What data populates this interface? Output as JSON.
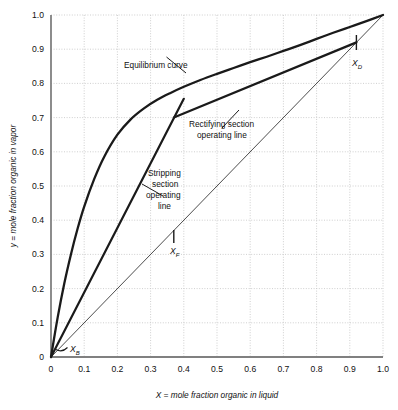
{
  "chart_data": {
    "type": "line",
    "title": "",
    "xlabel": "X = mole fraction organic in liquid",
    "ylabel": "y = mole fraction organic in vapor",
    "xlim": [
      0,
      1.0
    ],
    "ylim": [
      0,
      1.0
    ],
    "grid": true,
    "legend_position": "none",
    "xticks": [
      "0",
      "0.1",
      "0.2",
      "0.3",
      "0.4",
      "0.5",
      "0.6",
      "0.7",
      "0.8",
      "0.9",
      "1.0"
    ],
    "yticks": [
      "0",
      "0.1",
      "0.2",
      "0.3",
      "0.4",
      "0.5",
      "0.6",
      "0.7",
      "0.8",
      "0.9",
      "1.0"
    ],
    "xtick_values": [
      0,
      0.1,
      0.2,
      0.3,
      0.4,
      0.5,
      0.6,
      0.7,
      0.8,
      0.9,
      1.0
    ],
    "ytick_values": [
      0,
      0.1,
      0.2,
      0.3,
      0.4,
      0.5,
      0.6,
      0.7,
      0.8,
      0.9,
      1.0
    ],
    "series": [
      {
        "name": "Equilibrium curve",
        "style": "thick-solid",
        "x": [
          0.0,
          0.02,
          0.04,
          0.06,
          0.08,
          0.1,
          0.13,
          0.16,
          0.2,
          0.24,
          0.28,
          0.32,
          0.36,
          0.4,
          0.45,
          0.5,
          0.55,
          0.6,
          0.65,
          0.7,
          0.75,
          0.8,
          0.85,
          0.9,
          0.95,
          1.0
        ],
        "y": [
          0.0,
          0.115,
          0.215,
          0.3,
          0.375,
          0.44,
          0.52,
          0.585,
          0.65,
          0.695,
          0.727,
          0.752,
          0.772,
          0.79,
          0.81,
          0.828,
          0.845,
          0.862,
          0.878,
          0.895,
          0.912,
          0.93,
          0.948,
          0.965,
          0.982,
          1.0
        ]
      },
      {
        "name": "45 degree diagonal",
        "style": "thin-solid",
        "x": [
          0.0,
          1.0
        ],
        "y": [
          0.0,
          1.0
        ]
      },
      {
        "name": "Rectifying section operating line",
        "style": "thick-solid",
        "x": [
          0.37,
          0.92
        ],
        "y": [
          0.7,
          0.92
        ]
      },
      {
        "name": "Stripping section operating line",
        "style": "thick-solid",
        "x": [
          0.0,
          0.4
        ],
        "y": [
          0.0,
          0.755
        ]
      }
    ],
    "annotations": [
      {
        "label": "Equilibrium curve",
        "x": 0.26,
        "y": 0.875,
        "points_to_x": 0.345,
        "points_to_y": 0.765
      },
      {
        "label": "Rectifying section",
        "x": 0.5,
        "y": 0.672,
        "points_to_x": 0.565,
        "points_to_y": 0.755
      },
      {
        "label": "operating line",
        "x": 0.5,
        "y": 0.635,
        "points_to_x": null,
        "points_to_y": null
      },
      {
        "label": "Stripping",
        "x": 0.345,
        "y": 0.532,
        "points_to_x": 0.275,
        "points_to_y": 0.505
      },
      {
        "label": "section",
        "x": 0.345,
        "y": 0.492,
        "points_to_x": null,
        "points_to_y": null
      },
      {
        "label": "operating",
        "x": 0.345,
        "y": 0.452,
        "points_to_x": null,
        "points_to_y": null
      },
      {
        "label": "line",
        "x": 0.345,
        "y": 0.412,
        "points_to_x": null,
        "points_to_y": null
      }
    ],
    "marked_points": [
      {
        "symbol": "X",
        "subscript": "B",
        "x": 0.005,
        "y": 0.005,
        "label_x": 0.055,
        "label_y": 0.025
      },
      {
        "symbol": "X",
        "subscript": "F",
        "x": 0.37,
        "y": 0.37,
        "label_x": 0.375,
        "label_y": 0.315
      },
      {
        "symbol": "X",
        "subscript": "D",
        "x": 0.92,
        "y": 0.92,
        "label_x": 0.925,
        "label_y": 0.865
      }
    ]
  },
  "colors": {
    "grid": "#c9c9c9",
    "axis": "#808080",
    "curve": "#1a1a1a",
    "diagonal": "#4d4d4d",
    "text": "#111111",
    "background": "#ffffff"
  }
}
